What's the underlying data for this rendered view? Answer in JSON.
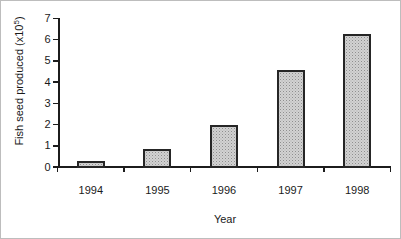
{
  "figure": {
    "background": "#ffffff",
    "frame_color": "#bdbdbd"
  },
  "chart_data": {
    "type": "bar",
    "title": "",
    "categories": [
      "1994",
      "1995",
      "1996",
      "1997",
      "1998"
    ],
    "values": [
      0.3,
      0.9,
      2.0,
      4.6,
      6.3
    ],
    "xlabel": "Year",
    "ylabel": "Fish seed produced (x10^5)",
    "ylabel_parts": {
      "prefix": "Fish seed produced (x10",
      "superscript": "5",
      "suffix": ")"
    },
    "ylim": [
      0,
      7
    ],
    "yticks": [
      0,
      1,
      2,
      3,
      4,
      5,
      6,
      7
    ],
    "x_boundary_ticks": 6,
    "grid": false,
    "legend": "none",
    "bar_fill": "#d2d2d2",
    "bar_pattern": "stipple-dots",
    "bar_pattern_color": "#8f8f8f",
    "bar_border_color": "#262626",
    "axis_color": "#1c1c1c",
    "text_color": "#1a1a1a"
  }
}
